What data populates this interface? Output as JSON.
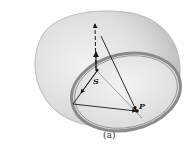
{
  "figure": {
    "caption": "(a)",
    "labels": {
      "source_point": "S",
      "field_point": "P"
    },
    "colors": {
      "surface": "#e2e2e2",
      "surface_shadow": "#c8c8c8",
      "ring": "#8a8a8a",
      "lines": "#1a1a1a"
    }
  }
}
